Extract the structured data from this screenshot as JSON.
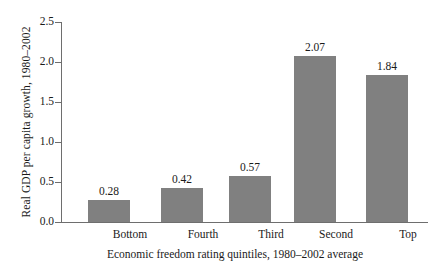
{
  "chart_data": {
    "type": "bar",
    "title": "",
    "categories": [
      "Bottom",
      "Fourth",
      "Third",
      "Second",
      "Top"
    ],
    "values": [
      0.28,
      0.42,
      0.57,
      2.07,
      1.84
    ],
    "value_labels": [
      "0.28",
      "0.42",
      "0.57",
      "2.07",
      "1.84"
    ],
    "xlabel": "Economic freedom rating quintiles, 1980–2002 average",
    "ylabel": "Real GDP per capita growth, 1980–2002",
    "ylim": [
      0.0,
      2.5
    ],
    "ytick_labels": [
      "0.0",
      "0.5",
      "1.0",
      "1.5",
      "2.0",
      "2.5"
    ],
    "ytick_values": [
      0.0,
      0.5,
      1.0,
      1.5,
      2.0,
      2.5
    ],
    "grid": false,
    "legend": null,
    "bar_color": "#808080",
    "axis_color": "#6e6e6e",
    "text_color": "#1a1a1a",
    "background_color": "#ffffff"
  }
}
